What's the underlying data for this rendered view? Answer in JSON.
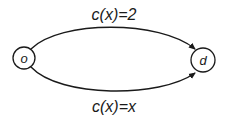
{
  "diagram": {
    "type": "directed-graph",
    "nodes": [
      {
        "id": "o",
        "label": "o"
      },
      {
        "id": "d",
        "label": "d"
      }
    ],
    "edges": [
      {
        "from": "o",
        "to": "d",
        "label": "c(x)=2",
        "position": "top"
      },
      {
        "from": "o",
        "to": "d",
        "label": "c(x)=x",
        "position": "bottom"
      }
    ],
    "colors": {
      "stroke": "#1a1a1a",
      "background": "#ffffff"
    }
  }
}
